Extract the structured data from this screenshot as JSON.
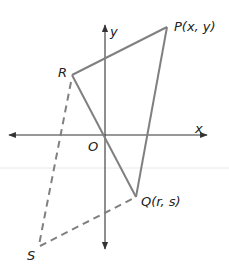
{
  "diagram": {
    "type": "coordinate-geometry",
    "colors": {
      "axis": "#333333",
      "solid_edge": "#808080",
      "dashed_edge": "#808080",
      "text": "#222222",
      "faint_line": "#e6e6e6"
    },
    "axes": {
      "x_label": "x",
      "y_label": "y",
      "origin_label": "O"
    },
    "points": {
      "P": {
        "label": "P(x, y)"
      },
      "Q": {
        "label": "Q(r, s)"
      },
      "R": {
        "label": "R"
      },
      "S": {
        "label": "S"
      }
    },
    "solid_segments": [
      "RP",
      "PQ",
      "QR"
    ],
    "dashed_segments": [
      "RS",
      "SQ"
    ]
  }
}
